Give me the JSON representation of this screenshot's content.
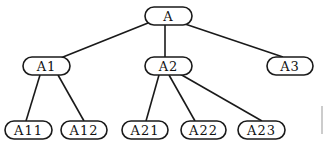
{
  "diagram": {
    "type": "tree",
    "line_color": "#1a1a1a",
    "node_border_color": "#1a1a1a",
    "node_fill": "#ffffff",
    "nodes": [
      {
        "id": "A",
        "label": "A",
        "x": 145,
        "y": 7,
        "w": 47,
        "h": 18
      },
      {
        "id": "A1",
        "label": "A1",
        "x": 23,
        "y": 57,
        "w": 47,
        "h": 18
      },
      {
        "id": "A2",
        "label": "A2",
        "x": 145,
        "y": 57,
        "w": 47,
        "h": 18
      },
      {
        "id": "A3",
        "label": "A3",
        "x": 267,
        "y": 57,
        "w": 46,
        "h": 18
      },
      {
        "id": "A11",
        "label": "A11",
        "x": 5,
        "y": 121,
        "w": 47,
        "h": 18
      },
      {
        "id": "A12",
        "label": "A12",
        "x": 61,
        "y": 121,
        "w": 46,
        "h": 18
      },
      {
        "id": "A21",
        "label": "A21",
        "x": 122,
        "y": 121,
        "w": 46,
        "h": 18
      },
      {
        "id": "A22",
        "label": "A22",
        "x": 181,
        "y": 121,
        "w": 45,
        "h": 18
      },
      {
        "id": "A23",
        "label": "A23",
        "x": 238,
        "y": 121,
        "w": 47,
        "h": 18
      }
    ],
    "edges": [
      {
        "from": "A",
        "to": "A1",
        "x1": 148,
        "y1": 23,
        "x2": 58,
        "y2": 59
      },
      {
        "from": "A",
        "to": "A2",
        "x1": 165,
        "y1": 25,
        "x2": 165,
        "y2": 57
      },
      {
        "from": "A",
        "to": "A3",
        "x1": 185,
        "y1": 24,
        "x2": 283,
        "y2": 57
      },
      {
        "from": "A1",
        "to": "A11",
        "x1": 40,
        "y1": 75,
        "x2": 26,
        "y2": 121
      },
      {
        "from": "A1",
        "to": "A12",
        "x1": 58,
        "y1": 75,
        "x2": 84,
        "y2": 121
      },
      {
        "from": "A2",
        "to": "A21",
        "x1": 159,
        "y1": 75,
        "x2": 146,
        "y2": 121
      },
      {
        "from": "A2",
        "to": "A22",
        "x1": 169,
        "y1": 75,
        "x2": 195,
        "y2": 121
      },
      {
        "from": "A2",
        "to": "A23",
        "x1": 180,
        "y1": 74,
        "x2": 262,
        "y2": 121
      }
    ],
    "artifact_line": {
      "x1": 322,
      "y1": 106,
      "x2": 322,
      "y2": 134,
      "color": "#999999"
    }
  }
}
